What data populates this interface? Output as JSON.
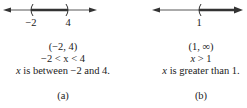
{
  "panels": [
    {
      "id": "a",
      "caption": "(a)",
      "number_line": {
        "ticks": [
          {
            "label": "−2"
          },
          {
            "label": "4"
          }
        ],
        "left_endpoint": "open",
        "right_endpoint": "open",
        "shaded": "between"
      },
      "interval_notation": "(−2, 4)",
      "inequality": "−2 < x < 4",
      "description_var": "x",
      "description_rest": " is between −2 and 4."
    },
    {
      "id": "b",
      "caption": "(b)",
      "number_line": {
        "ticks": [
          {
            "label": "1"
          }
        ],
        "left_endpoint": "open",
        "shaded": "right-to-infinity"
      },
      "interval_notation": "(1, ∞)",
      "inequality_var": "x",
      "inequality_rest": " > 1",
      "description_var": "x",
      "description_rest": " is greater than 1."
    }
  ]
}
